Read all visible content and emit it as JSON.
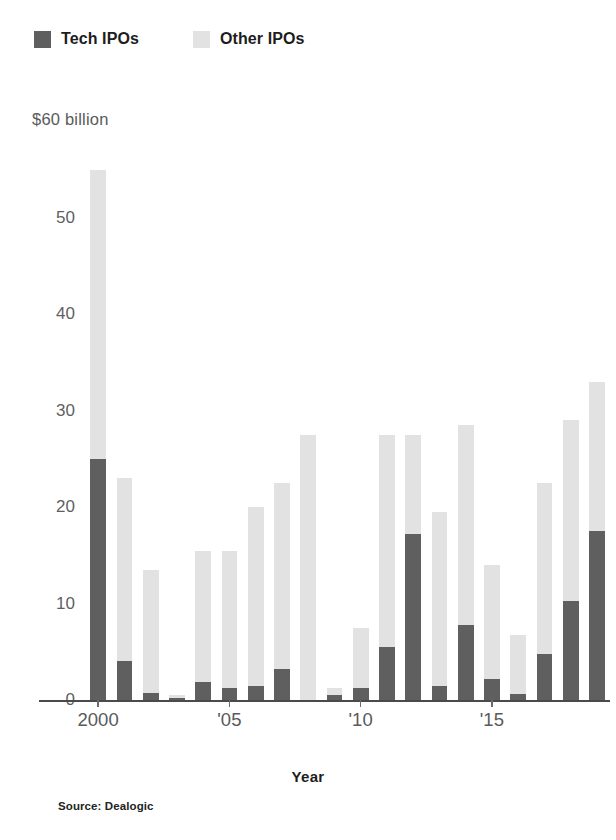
{
  "legend": {
    "position": "top-left",
    "entries": [
      {
        "label": "Tech IPOs",
        "color": "#5f5f5f",
        "name": "tech-ipos"
      },
      {
        "label": "Other IPOs",
        "color": "#e2e2e2",
        "name": "other-ipos"
      }
    ]
  },
  "unit_caption": "$60 billion",
  "axis_title": "Year",
  "source_note": "Source: Dealogic",
  "chart_data": {
    "type": "bar",
    "stacked": true,
    "title": "",
    "subtitle": "",
    "xlabel": "Year",
    "ylabel": "$60 billion",
    "ylim": [
      0,
      56
    ],
    "yticks": [
      0,
      10,
      20,
      30,
      40,
      50
    ],
    "ytick_labels": [
      "0",
      "10",
      "20",
      "30",
      "40",
      "50"
    ],
    "grid": false,
    "legend_position": "top-left",
    "categories": [
      "2000",
      "2001",
      "2002",
      "2003",
      "2004",
      "2005",
      "2006",
      "2007",
      "2008",
      "2009",
      "2010",
      "2011",
      "2012",
      "2013",
      "2014",
      "2015",
      "2016",
      "2017",
      "2018",
      "2019"
    ],
    "xtick_positions": [
      "2000",
      "2005",
      "2010",
      "2015"
    ],
    "xtick_labels": [
      "2000",
      "'05",
      "'10",
      "'15"
    ],
    "series": [
      {
        "name": "Tech IPOs",
        "color": "#5f5f5f",
        "values": [
          25.0,
          4.0,
          0.7,
          0.2,
          1.9,
          1.2,
          1.5,
          3.2,
          0.0,
          0.5,
          1.2,
          5.5,
          17.2,
          1.5,
          7.8,
          2.2,
          0.6,
          4.8,
          10.3,
          17.5
        ]
      },
      {
        "name": "Other IPOs",
        "color": "#e2e2e2",
        "values": [
          30.0,
          19.0,
          12.8,
          0.3,
          13.6,
          14.3,
          18.5,
          19.3,
          27.5,
          0.7,
          6.3,
          22.0,
          10.3,
          18.0,
          20.7,
          11.8,
          6.1,
          17.7,
          18.7,
          15.5
        ]
      }
    ],
    "totals": [
      55.0,
      23.0,
      13.5,
      0.5,
      15.5,
      15.5,
      20.0,
      22.5,
      27.5,
      1.2,
      7.5,
      27.5,
      27.5,
      19.5,
      28.5,
      14.0,
      6.7,
      22.5,
      29.0,
      33.0
    ]
  }
}
